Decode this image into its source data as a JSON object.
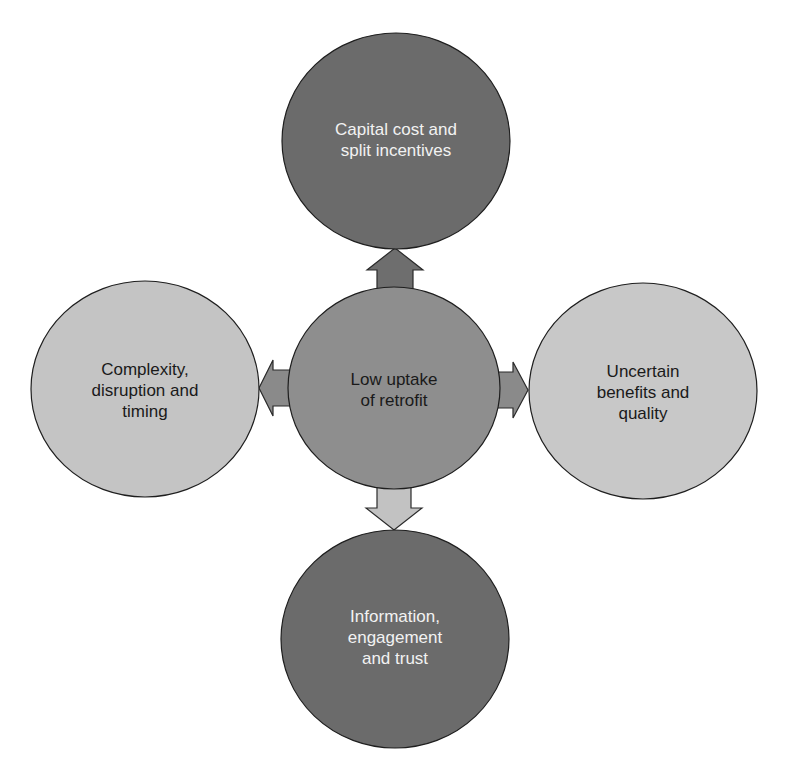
{
  "diagram": {
    "type": "hub-and-spoke",
    "center": {
      "label": "Low uptake\nof retrofit",
      "fill": "#8e8e8e"
    },
    "nodes": [
      {
        "position": "top",
        "label": "Capital cost and\nsplit incentives",
        "fill": "#6b6b6b",
        "text_color": "#f2f2f2"
      },
      {
        "position": "left",
        "label": "Complexity,\ndisruption and\ntiming",
        "fill": "#c4c4c4",
        "text_color": "#1a1a1a"
      },
      {
        "position": "right",
        "label": "Uncertain\nbenefits and\nquality",
        "fill": "#c8c8c8",
        "text_color": "#1a1a1a"
      },
      {
        "position": "bottom",
        "label": "Information,\nengagement\nand trust",
        "fill": "#6b6b6b",
        "text_color": "#f2f2f2"
      }
    ],
    "arrows": [
      {
        "from": "center",
        "to": "top",
        "fill": "#6e6e6e"
      },
      {
        "from": "center",
        "to": "left",
        "fill": "#8a8a8a"
      },
      {
        "from": "center",
        "to": "right",
        "fill": "#8a8a8a"
      },
      {
        "from": "center",
        "to": "bottom",
        "fill": "#c2c2c2"
      }
    ]
  }
}
